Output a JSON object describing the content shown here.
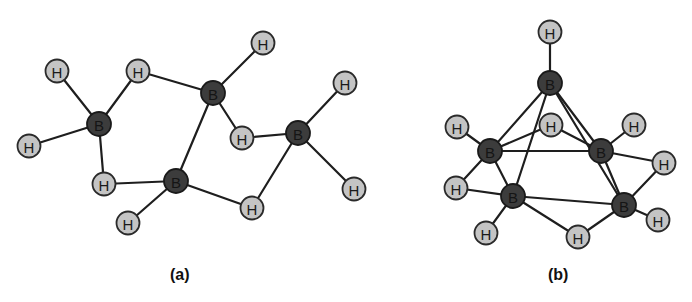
{
  "figure": {
    "panels": [
      {
        "id": "a",
        "caption": "(a)",
        "caption_pos": [
          170,
          266
        ],
        "atoms": [
          {
            "el": "B",
            "label": "B",
            "x": 99,
            "y": 124
          },
          {
            "el": "B",
            "label": "B",
            "x": 213,
            "y": 93
          },
          {
            "el": "B",
            "label": "B",
            "x": 176,
            "y": 181
          },
          {
            "el": "B",
            "label": "B",
            "x": 298,
            "y": 133
          },
          {
            "el": "H",
            "label": "H",
            "x": 57,
            "y": 71
          },
          {
            "el": "H",
            "label": "H",
            "x": 138,
            "y": 71
          },
          {
            "el": "H",
            "label": "H",
            "x": 29,
            "y": 146
          },
          {
            "el": "H",
            "label": "H",
            "x": 104,
            "y": 184
          },
          {
            "el": "H",
            "label": "H",
            "x": 263,
            "y": 43
          },
          {
            "el": "H",
            "label": "H",
            "x": 242,
            "y": 138
          },
          {
            "el": "H",
            "label": "H",
            "x": 128,
            "y": 223
          },
          {
            "el": "H",
            "label": "H",
            "x": 252,
            "y": 208
          },
          {
            "el": "H",
            "label": "H",
            "x": 345,
            "y": 83
          },
          {
            "el": "H",
            "label": "H",
            "x": 354,
            "y": 189
          }
        ],
        "bonds": [
          [
            0,
            4
          ],
          [
            0,
            5
          ],
          [
            0,
            6
          ],
          [
            0,
            7
          ],
          [
            5,
            1
          ],
          [
            7,
            2
          ],
          [
            1,
            8
          ],
          [
            1,
            9
          ],
          [
            1,
            2
          ],
          [
            9,
            3
          ],
          [
            2,
            10
          ],
          [
            2,
            11
          ],
          [
            11,
            3
          ],
          [
            3,
            12
          ],
          [
            3,
            13
          ]
        ]
      },
      {
        "id": "b",
        "caption": "(b)",
        "caption_pos": [
          548,
          266
        ],
        "atoms": [
          {
            "el": "B",
            "label": "B",
            "x": 550,
            "y": 83
          },
          {
            "el": "B",
            "label": "B",
            "x": 490,
            "y": 151
          },
          {
            "el": "B",
            "label": "B",
            "x": 601,
            "y": 151
          },
          {
            "el": "B",
            "label": "B",
            "x": 513,
            "y": 196
          },
          {
            "el": "B",
            "label": "B",
            "x": 624,
            "y": 205
          },
          {
            "el": "H",
            "label": "H",
            "x": 550,
            "y": 32
          },
          {
            "el": "H",
            "label": "H",
            "x": 457,
            "y": 127
          },
          {
            "el": "H",
            "label": "H",
            "x": 551,
            "y": 125
          },
          {
            "el": "H",
            "label": "H",
            "x": 634,
            "y": 125
          },
          {
            "el": "H",
            "label": "H",
            "x": 456,
            "y": 188
          },
          {
            "el": "H",
            "label": "H",
            "x": 664,
            "y": 163
          },
          {
            "el": "H",
            "label": "H",
            "x": 486,
            "y": 233
          },
          {
            "el": "H",
            "label": "H",
            "x": 578,
            "y": 237
          },
          {
            "el": "H",
            "label": "H",
            "x": 658,
            "y": 220
          }
        ],
        "bonds": [
          [
            0,
            5
          ],
          [
            0,
            1
          ],
          [
            0,
            2
          ],
          [
            0,
            3
          ],
          [
            0,
            4
          ],
          [
            1,
            6
          ],
          [
            1,
            7
          ],
          [
            7,
            2
          ],
          [
            1,
            2
          ],
          [
            1,
            9
          ],
          [
            1,
            3
          ],
          [
            9,
            3
          ],
          [
            2,
            8
          ],
          [
            2,
            10
          ],
          [
            2,
            4
          ],
          [
            10,
            4
          ],
          [
            3,
            4
          ],
          [
            3,
            11
          ],
          [
            3,
            12
          ],
          [
            12,
            4
          ],
          [
            4,
            13
          ]
        ]
      }
    ]
  }
}
